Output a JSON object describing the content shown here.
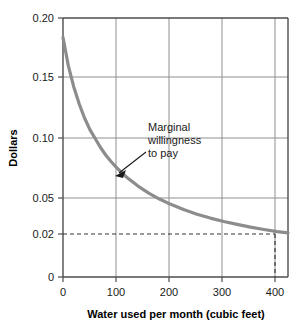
{
  "chart_data": {
    "type": "line",
    "title": "",
    "xlabel": "Water used per month (cubic feet)",
    "ylabel": "Dollars",
    "xlim": [
      0,
      420
    ],
    "ylim": [
      0,
      0.2
    ],
    "grid": true,
    "legend_position": "none",
    "x_ticks": [
      "0",
      "100",
      "200",
      "300",
      "400"
    ],
    "x_tick_values": [
      0,
      100,
      200,
      300,
      400
    ],
    "y_ticks": [
      "0",
      "0.02",
      "0.05",
      "0.10",
      "0.15",
      "0.20"
    ],
    "y_tick_values": [
      0,
      0.02,
      0.05,
      0.1,
      0.15,
      0.2
    ],
    "series": [
      {
        "name": "Marginal willingness to pay",
        "color": "#8c8c8c",
        "x": [
          0,
          10,
          20,
          30,
          40,
          50,
          60,
          70,
          80,
          90,
          100,
          120,
          140,
          160,
          180,
          200,
          225,
          250,
          275,
          300,
          325,
          350,
          375,
          400,
          420
        ],
        "values": [
          0.185,
          0.163,
          0.147,
          0.134,
          0.123,
          0.114,
          0.107,
          0.1,
          0.094,
          0.089,
          0.0845,
          0.0766,
          0.0702,
          0.0648,
          0.0602,
          0.0563,
          0.0521,
          0.0485,
          0.0455,
          0.0429,
          0.0406,
          0.0385,
          0.0367,
          0.0351,
          0.0341
        ]
      }
    ],
    "annotations": [
      {
        "name": "marginal-willingness-to-pay",
        "lines": [
          "Marginal",
          "willingness",
          "to pay"
        ],
        "arrow_from": [
          163,
          77
        ],
        "arrow_to": [
          111,
          107
        ]
      }
    ],
    "reference_lines": [
      {
        "name": "price-line",
        "orientation": "horizontal",
        "value": 0.02,
        "style": "dashed"
      },
      {
        "name": "quantity-line",
        "orientation": "vertical",
        "value": 400,
        "style": "dashed"
      }
    ]
  },
  "colors": {
    "curve": "#8c8c8c",
    "grid": "#8f8f8f",
    "axis": "#4d4d4d",
    "dashed": "#333333",
    "text": "#1a1a1a",
    "background": "#ffffff"
  }
}
